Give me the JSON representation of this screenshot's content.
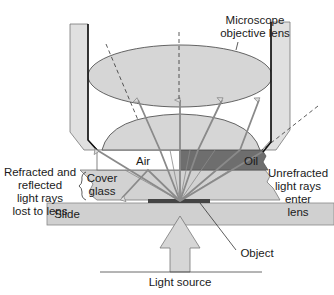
{
  "labels": {
    "objective_lens": "Microscope\nobjective lens",
    "air": "Air",
    "oil": "Oil",
    "refracted": "Refracted and\nreflected\nlight rays\nlost to lens",
    "cover_glass": "Cover\nglass",
    "unrefracted": "Unrefracted\nlight rays\nenter\nlens",
    "slide": "Slide",
    "object": "Object",
    "light_source": "Light source"
  },
  "colors": {
    "lens_fill": "#d6d6d6",
    "housing_fill": "#e0e0e0",
    "oil_fill": "#6e6e6e",
    "glass_fill": "#d2d2d2",
    "slide_fill": "#d0d0d0",
    "ray": "#8a8a8a",
    "object": "#444444",
    "outline": "#3a3a3a"
  }
}
